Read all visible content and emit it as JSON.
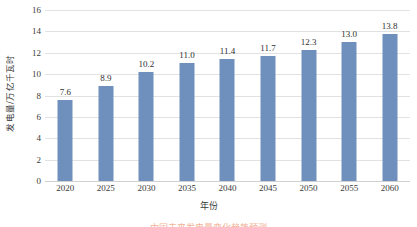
{
  "chart_data": {
    "type": "bar",
    "title": "",
    "xlabel": "年份",
    "ylabel": "发电量/万亿千瓦时",
    "categories": [
      "2020",
      "2025",
      "2030",
      "2035",
      "2040",
      "2045",
      "2050",
      "2055",
      "2060"
    ],
    "values": [
      7.6,
      8.9,
      10.2,
      11.0,
      11.4,
      11.7,
      12.3,
      13.0,
      13.8
    ],
    "value_labels": [
      "7.6",
      "8.9",
      "10.2",
      "11.0",
      "11.4",
      "11.7",
      "12.3",
      "13.0",
      "13.8"
    ],
    "ylim": [
      0,
      16
    ],
    "yticks": [
      0,
      2,
      4,
      6,
      8,
      10,
      12,
      14,
      16
    ],
    "ytick_labels": [
      "0",
      "2",
      "4",
      "6",
      "8",
      "10",
      "12",
      "14",
      "16"
    ],
    "grid": true,
    "grid_axis": "y",
    "legend": false,
    "series_color": "#6f8fbd",
    "grid_color": "#e2e2e2",
    "text_color": "#3b3b3b"
  },
  "caption": {
    "text": "中国未来发电量变化趋势预测",
    "color": "#e8703a"
  }
}
